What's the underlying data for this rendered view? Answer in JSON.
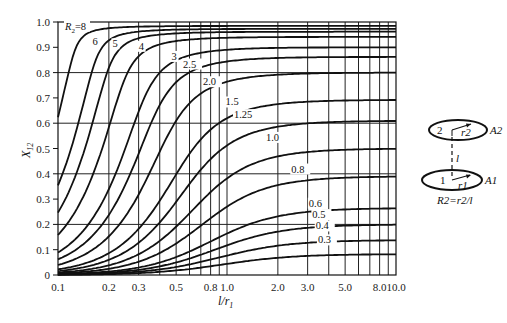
{
  "chart_data": {
    "type": "line",
    "title": "",
    "xlabel": "l/r1",
    "ylabel": "X12",
    "xscale": "log",
    "xlim": [
      0.1,
      10.0
    ],
    "ylim": [
      0,
      1.0
    ],
    "grid": true,
    "x_tick_labels": [
      "0.1",
      "0.2",
      "0.3",
      "0.5",
      "0.8",
      "1.0",
      "2.0",
      "3.0",
      "5.0",
      "8.0",
      "10.0"
    ],
    "x_ticks": [
      0.1,
      0.2,
      0.3,
      0.5,
      0.8,
      1.0,
      2.0,
      3.0,
      5.0,
      8.0,
      10.0
    ],
    "x_gridlines": [
      0.2,
      0.3,
      0.4,
      0.5,
      0.6,
      0.7,
      0.8,
      0.9,
      1,
      2,
      3,
      4,
      5,
      6,
      7,
      8,
      9
    ],
    "y_tick_labels": [
      "0",
      "0.1",
      "0.2",
      "0.3",
      "0.4",
      "0.5",
      "0.6",
      "0.7",
      "0.8",
      "0.9",
      "1.0"
    ],
    "y_ticks": [
      0,
      0.1,
      0.2,
      0.3,
      0.4,
      0.5,
      0.6,
      0.7,
      0.8,
      0.9,
      1.0
    ],
    "y_gridlines": [
      0.2,
      0.4,
      0.6,
      0.8
    ],
    "legend": "curves labelled in-plot by R2 value",
    "x": [
      0.1,
      0.15,
      0.2,
      0.3,
      0.5,
      0.8,
      1.0,
      2.0,
      3.0,
      5.0,
      8.0,
      10.0
    ],
    "series": [
      {
        "name": "R2=8",
        "label": "R2=8",
        "r2": 8,
        "values": [
          0.72,
          0.92,
          0.96,
          0.98,
          0.98,
          0.98,
          0.98,
          0.98,
          0.98,
          0.98,
          0.98,
          0.98
        ]
      },
      {
        "name": "6",
        "label": "6",
        "r2": 6,
        "values": [
          0.34,
          0.63,
          0.82,
          0.94,
          0.97,
          0.97,
          0.97,
          0.97,
          0.97,
          0.97,
          0.97,
          0.97
        ]
      },
      {
        "name": "5",
        "label": "5",
        "r2": 5,
        "values": [
          0.24,
          0.46,
          0.66,
          0.89,
          0.96,
          0.96,
          0.96,
          0.96,
          0.96,
          0.96,
          0.96,
          0.96
        ]
      },
      {
        "name": "4",
        "label": "4",
        "r2": 4,
        "values": [
          0.15,
          0.31,
          0.46,
          0.74,
          0.92,
          0.94,
          0.94,
          0.94,
          0.94,
          0.94,
          0.94,
          0.94
        ]
      },
      {
        "name": "3",
        "label": "3",
        "r2": 3,
        "values": [
          0.08,
          0.18,
          0.29,
          0.5,
          0.81,
          0.88,
          0.89,
          0.9,
          0.9,
          0.9,
          0.9,
          0.9
        ]
      },
      {
        "name": "2.5",
        "label": "2.5",
        "r2": 2.5,
        "values": [
          0.06,
          0.13,
          0.21,
          0.38,
          0.68,
          0.82,
          0.84,
          0.86,
          0.86,
          0.86,
          0.86,
          0.86
        ]
      },
      {
        "name": "2.0",
        "label": "2.0",
        "r2": 2.0,
        "values": [
          0.04,
          0.08,
          0.14,
          0.27,
          0.52,
          0.71,
          0.75,
          0.79,
          0.8,
          0.8,
          0.8,
          0.8
        ]
      },
      {
        "name": "1.5",
        "label": "1.5",
        "r2": 1.5,
        "values": [
          0.02,
          0.05,
          0.08,
          0.16,
          0.35,
          0.53,
          0.59,
          0.67,
          0.69,
          0.69,
          0.69,
          0.69
        ]
      },
      {
        "name": "1.25",
        "label": "1.25",
        "r2": 1.25,
        "values": [
          0.02,
          0.03,
          0.06,
          0.12,
          0.26,
          0.42,
          0.48,
          0.58,
          0.6,
          0.61,
          0.61,
          0.61
        ]
      },
      {
        "name": "1.0",
        "label": "1.0",
        "r2": 1.0,
        "values": [
          0.01,
          0.02,
          0.04,
          0.08,
          0.18,
          0.31,
          0.38,
          0.47,
          0.49,
          0.5,
          0.5,
          0.5
        ]
      },
      {
        "name": "0.8",
        "label": "0.8",
        "r2": 0.8,
        "values": [
          0.01,
          0.01,
          0.03,
          0.05,
          0.13,
          0.23,
          0.28,
          0.37,
          0.39,
          0.39,
          0.39,
          0.39
        ]
      },
      {
        "name": "0.6",
        "label": "0.6",
        "r2": 0.6,
        "values": [
          0.0,
          0.01,
          0.01,
          0.03,
          0.08,
          0.15,
          0.19,
          0.26,
          0.27,
          0.28,
          0.28,
          0.28
        ]
      },
      {
        "name": "0.5",
        "label": "0.5",
        "r2": 0.5,
        "values": [
          0.0,
          0.01,
          0.01,
          0.02,
          0.06,
          0.11,
          0.14,
          0.19,
          0.2,
          0.2,
          0.2,
          0.2
        ]
      },
      {
        "name": "0.4",
        "label": "0.4",
        "r2": 0.4,
        "values": [
          0.0,
          0.0,
          0.01,
          0.01,
          0.04,
          0.08,
          0.1,
          0.14,
          0.14,
          0.14,
          0.14,
          0.14
        ]
      },
      {
        "name": "0.3",
        "label": "0.3",
        "r2": 0.3,
        "values": [
          0.0,
          0.0,
          0.0,
          0.01,
          0.02,
          0.05,
          0.06,
          0.08,
          0.08,
          0.08,
          0.08,
          0.08
        ]
      }
    ],
    "annotations": [
      {
        "text": "R2=8",
        "x": 0.11,
        "y": 0.97
      },
      {
        "text": "6",
        "x": 0.16,
        "y": 0.91
      },
      {
        "text": "5",
        "x": 0.21,
        "y": 0.9
      },
      {
        "text": "4",
        "x": 0.3,
        "y": 0.89
      },
      {
        "text": "3",
        "x": 0.47,
        "y": 0.85
      },
      {
        "text": "2.5",
        "x": 0.55,
        "y": 0.82
      },
      {
        "text": "2.0",
        "x": 0.72,
        "y": 0.75
      },
      {
        "text": "1.5",
        "x": 0.98,
        "y": 0.67
      },
      {
        "text": "1.25",
        "x": 1.1,
        "y": 0.62
      },
      {
        "text": "1.0",
        "x": 1.7,
        "y": 0.53
      },
      {
        "text": "0.8",
        "x": 2.4,
        "y": 0.405
      },
      {
        "text": "0.6",
        "x": 3.05,
        "y": 0.27
      },
      {
        "text": "0.5",
        "x": 3.2,
        "y": 0.225
      },
      {
        "text": "0.4",
        "x": 3.35,
        "y": 0.18
      },
      {
        "text": "0.3",
        "x": 3.45,
        "y": 0.125
      }
    ]
  },
  "diagram": {
    "disk_top_number": "2",
    "disk_top_radius": "r2",
    "disk_top_area": "A2",
    "separation": "l",
    "disk_bottom_number": "1",
    "disk_bottom_radius": "r1",
    "disk_bottom_area": "A1",
    "relation": "R2=r2/l"
  },
  "axes": {
    "xlabel_main": "l/r",
    "xlabel_sub": "1",
    "ylabel_main": "X",
    "ylabel_sub": "12"
  }
}
